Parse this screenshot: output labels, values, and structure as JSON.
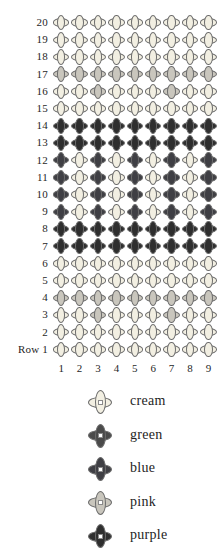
{
  "chart_data": {
    "type": "heatmap",
    "title": "",
    "xlabel": "",
    "ylabel": "Row",
    "row_axis_prefix": "Row",
    "columns": [
      1,
      2,
      3,
      4,
      5,
      6,
      7,
      8,
      9
    ],
    "rows": [
      20,
      19,
      18,
      17,
      16,
      15,
      14,
      13,
      12,
      11,
      10,
      9,
      8,
      7,
      6,
      5,
      4,
      3,
      2,
      1
    ],
    "row_labels": [
      "20",
      "19",
      "18",
      "17",
      "16",
      "15",
      "14",
      "13",
      "12",
      "11",
      "10",
      "9",
      "8",
      "7",
      "6",
      "5",
      "4",
      "3",
      "2",
      "Row 1"
    ],
    "column_labels": [
      "1",
      "2",
      "3",
      "4",
      "5",
      "6",
      "7",
      "8",
      "9"
    ],
    "palette": {
      "cream": "#f2efe2",
      "green": "#4a4a4a",
      "blue": "#3f3f44",
      "pink": "#c9c6bd",
      "purple": "#2e2e2e"
    },
    "legend_order": [
      "cream",
      "green",
      "blue",
      "pink",
      "purple"
    ],
    "grid": [
      {
        "row": 20,
        "cells": [
          "cream",
          "cream",
          "cream",
          "cream",
          "cream",
          "cream",
          "cream",
          "cream",
          "cream"
        ]
      },
      {
        "row": 19,
        "cells": [
          "cream",
          "cream",
          "cream",
          "cream",
          "cream",
          "cream",
          "cream",
          "cream",
          "cream"
        ]
      },
      {
        "row": 18,
        "cells": [
          "cream",
          "cream",
          "cream",
          "cream",
          "cream",
          "cream",
          "cream",
          "cream",
          "cream"
        ]
      },
      {
        "row": 17,
        "cells": [
          "pink",
          "pink",
          "pink",
          "pink",
          "pink",
          "pink",
          "pink",
          "pink",
          "pink"
        ]
      },
      {
        "row": 16,
        "cells": [
          "cream",
          "cream",
          "pink",
          "cream",
          "cream",
          "cream",
          "pink",
          "cream",
          "cream"
        ]
      },
      {
        "row": 15,
        "cells": [
          "cream",
          "cream",
          "cream",
          "cream",
          "cream",
          "cream",
          "cream",
          "cream",
          "cream"
        ]
      },
      {
        "row": 14,
        "cells": [
          "purple",
          "purple",
          "purple",
          "purple",
          "purple",
          "purple",
          "purple",
          "purple",
          "purple"
        ]
      },
      {
        "row": 13,
        "cells": [
          "purple",
          "purple",
          "purple",
          "purple",
          "purple",
          "purple",
          "purple",
          "purple",
          "purple"
        ]
      },
      {
        "row": 12,
        "cells": [
          "blue",
          "cream",
          "blue",
          "cream",
          "blue",
          "cream",
          "blue",
          "cream",
          "blue"
        ]
      },
      {
        "row": 11,
        "cells": [
          "blue",
          "cream",
          "blue",
          "cream",
          "blue",
          "cream",
          "blue",
          "cream",
          "blue"
        ]
      },
      {
        "row": 10,
        "cells": [
          "blue",
          "cream",
          "blue",
          "cream",
          "blue",
          "cream",
          "blue",
          "cream",
          "blue"
        ]
      },
      {
        "row": 9,
        "cells": [
          "blue",
          "cream",
          "blue",
          "cream",
          "blue",
          "cream",
          "blue",
          "cream",
          "blue"
        ]
      },
      {
        "row": 8,
        "cells": [
          "purple",
          "purple",
          "purple",
          "purple",
          "purple",
          "purple",
          "purple",
          "purple",
          "purple"
        ]
      },
      {
        "row": 7,
        "cells": [
          "purple",
          "purple",
          "purple",
          "purple",
          "purple",
          "purple",
          "purple",
          "purple",
          "purple"
        ]
      },
      {
        "row": 6,
        "cells": [
          "cream",
          "cream",
          "cream",
          "cream",
          "cream",
          "cream",
          "cream",
          "cream",
          "cream"
        ]
      },
      {
        "row": 5,
        "cells": [
          "cream",
          "cream",
          "cream",
          "cream",
          "cream",
          "cream",
          "cream",
          "cream",
          "cream"
        ]
      },
      {
        "row": 4,
        "cells": [
          "pink",
          "pink",
          "pink",
          "pink",
          "pink",
          "pink",
          "pink",
          "pink",
          "pink"
        ]
      },
      {
        "row": 3,
        "cells": [
          "cream",
          "cream",
          "pink",
          "cream",
          "cream",
          "cream",
          "pink",
          "cream",
          "cream"
        ]
      },
      {
        "row": 2,
        "cells": [
          "cream",
          "cream",
          "cream",
          "cream",
          "cream",
          "cream",
          "cream",
          "cream",
          "cream"
        ]
      },
      {
        "row": 1,
        "cells": [
          "cream",
          "cream",
          "cream",
          "cream",
          "cream",
          "cream",
          "cream",
          "cream",
          "cream"
        ]
      }
    ],
    "legend": [
      {
        "key": "cream",
        "label": "cream",
        "color": "#f2efe2"
      },
      {
        "key": "green",
        "label": "green",
        "color": "#4a4a4a"
      },
      {
        "key": "blue",
        "label": "blue",
        "color": "#3f3f44"
      },
      {
        "key": "pink",
        "label": "pink",
        "color": "#c9c6bd"
      },
      {
        "key": "purple",
        "label": "purple",
        "color": "#2e2e2e"
      }
    ]
  }
}
